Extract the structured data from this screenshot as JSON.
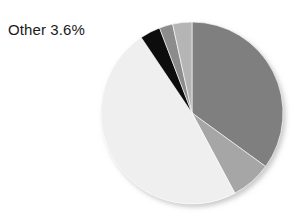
{
  "figure": {
    "background_color": "#ffffff",
    "annotation": {
      "name": "other-callout",
      "text": "Other 3.6%",
      "color": "#1a1a1a"
    }
  },
  "chart_data": {
    "type": "pie",
    "title": "",
    "xlabel": "",
    "ylabel": "",
    "grid": false,
    "legend": "none",
    "start_angle_deg": 0,
    "direction": "clockwise",
    "center": {
      "cx": 192,
      "cy": 113,
      "r": 91
    },
    "categories": [
      "Segment 1",
      "Segment 2",
      "Segment 3",
      "Other",
      "Segment 5",
      "Segment 6"
    ],
    "values": [
      35.0,
      7.2,
      48.4,
      3.6,
      2.4,
      3.4
    ],
    "colors": [
      "#7f7f7f",
      "#a6a6a6",
      "#efefef",
      "#0d0d0d",
      "#8c8c8c",
      "#b5b5b5"
    ],
    "labels": [
      {
        "category": "Other",
        "text": "Other 3.6%",
        "value": 3.6,
        "shown": true
      }
    ],
    "slices": [
      {
        "name": "slice-1",
        "color": "#7f7f7f",
        "start_deg": 0,
        "end_deg": 126.0,
        "value": 35.0
      },
      {
        "name": "slice-2",
        "color": "#a6a6a6",
        "start_deg": 126.0,
        "end_deg": 151.9,
        "value": 7.2
      },
      {
        "name": "slice-3",
        "color": "#efefef",
        "start_deg": 151.9,
        "end_deg": 326.1,
        "value": 48.4
      },
      {
        "name": "slice-other",
        "color": "#0d0d0d",
        "start_deg": 326.1,
        "end_deg": 339.1,
        "value": 3.6
      },
      {
        "name": "slice-5",
        "color": "#8c8c8c",
        "start_deg": 339.1,
        "end_deg": 347.7,
        "value": 2.4
      },
      {
        "name": "slice-6",
        "color": "#b5b5b5",
        "start_deg": 347.7,
        "end_deg": 360.0,
        "value": 3.4
      }
    ]
  }
}
